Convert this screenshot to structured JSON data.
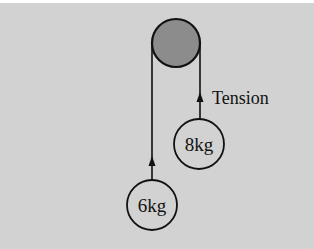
{
  "diagram": {
    "type": "pulley-system",
    "colors": {
      "background": "#d2d2d2",
      "pulley_fill": "#8c8c8c",
      "stroke": "#111111"
    },
    "pulley": {
      "label": ""
    },
    "masses": [
      {
        "label": "8kg",
        "side": "right"
      },
      {
        "label": "6kg",
        "side": "left"
      }
    ],
    "force_label": "Tension"
  }
}
